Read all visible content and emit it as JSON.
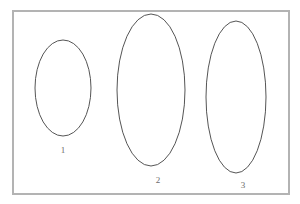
{
  "figure": {
    "background_color": "#ffffff",
    "frame": {
      "name": "figure-border",
      "x": 13,
      "y": 11,
      "width": 276,
      "height": 183,
      "stroke_color": "#b3b3b3",
      "stroke_width": 2,
      "fill": "none"
    },
    "shape_style": {
      "stroke_color": "#555555",
      "stroke_width": 1,
      "fill": "none"
    },
    "label_style": {
      "color": "#6b6b6b",
      "font_size": 9
    },
    "shapes": [
      {
        "name": "ellipse-1",
        "label": "1",
        "cx": 63,
        "cy": 88,
        "rx": 28,
        "ry": 48,
        "label_x": 63,
        "label_y": 146
      },
      {
        "name": "ellipse-2",
        "label": "2",
        "cx": 151,
        "cy": 90,
        "rx": 34,
        "ry": 76,
        "label_x": 158,
        "label_y": 176
      },
      {
        "name": "ellipse-3",
        "label": "3",
        "cx": 236,
        "cy": 97,
        "rx": 30,
        "ry": 76,
        "label_x": 243,
        "label_y": 181
      }
    ]
  }
}
